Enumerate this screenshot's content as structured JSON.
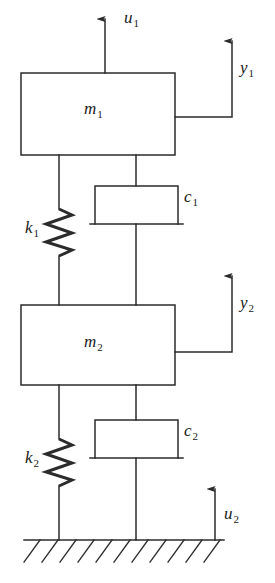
{
  "figure": {
    "type": "schematic-diagram",
    "width": 275,
    "height": 583,
    "line_color": "#2b2b2b",
    "text_color": "#1a1a1a",
    "background_color": "#ffffff"
  },
  "labels": {
    "mass_1": {
      "symbol": "m",
      "subscript": "1"
    },
    "mass_2": {
      "symbol": "m",
      "subscript": "2"
    },
    "spring_1": {
      "symbol": "k",
      "subscript": "1"
    },
    "spring_2": {
      "symbol": "k",
      "subscript": "2"
    },
    "damper_1": {
      "symbol": "c",
      "subscript": "1"
    },
    "damper_2": {
      "symbol": "c",
      "subscript": "2"
    },
    "input_1": {
      "symbol": "u",
      "subscript": "1"
    },
    "input_2": {
      "symbol": "u",
      "subscript": "2"
    },
    "output_1": {
      "symbol": "y",
      "subscript": "1"
    },
    "output_2": {
      "symbol": "y",
      "subscript": "2"
    }
  },
  "components": [
    {
      "name": "mass-1-block",
      "label": "m1",
      "shape": "rectangle"
    },
    {
      "name": "mass-2-block",
      "label": "m2",
      "shape": "rectangle"
    },
    {
      "name": "spring-1",
      "label": "k1",
      "shape": "zigzag"
    },
    {
      "name": "spring-2",
      "label": "k2",
      "shape": "zigzag"
    },
    {
      "name": "damper-1",
      "label": "c1",
      "shape": "dashpot"
    },
    {
      "name": "damper-2",
      "label": "c2",
      "shape": "dashpot"
    },
    {
      "name": "ground",
      "label": "",
      "shape": "hatched-line"
    }
  ],
  "arrows": [
    {
      "name": "input-1-arrow",
      "label": "u1",
      "direction": "up",
      "attached_to": "mass-1-block"
    },
    {
      "name": "output-1-arrow",
      "label": "y1",
      "direction": "up",
      "attached_to": "mass-1-block"
    },
    {
      "name": "output-2-arrow",
      "label": "y2",
      "direction": "up",
      "attached_to": "mass-2-block"
    },
    {
      "name": "input-2-arrow",
      "label": "u2",
      "direction": "up",
      "attached_to": "ground"
    }
  ]
}
